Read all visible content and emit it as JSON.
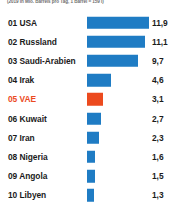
{
  "chart_data": {
    "type": "bar",
    "title": "",
    "subtitle": "(2019 in Mio. Barrels pro Tag, 1 Barrel = 159 l)",
    "xlabel": "",
    "ylabel": "",
    "orientation": "horizontal",
    "grid": false,
    "legend": false,
    "xlim": [
      0,
      12.1
    ],
    "categories": [
      "01 USA",
      "02 Russland",
      "03 Saudi-Arabien",
      "04 Irak",
      "05 VAE",
      "06 Kuwait",
      "07 Iran",
      "08 Nigeria",
      "09 Angola",
      "10 Libyen"
    ],
    "values": [
      11.9,
      11.1,
      9.7,
      4.6,
      3.1,
      2.7,
      2.3,
      1.6,
      1.5,
      1.3
    ],
    "value_labels": [
      "11,9",
      "11,1",
      "9,7",
      "4,6",
      "3,1",
      "2,7",
      "2,3",
      "1,6",
      "1,5",
      "1,3"
    ],
    "highlight_index": 4,
    "colors": {
      "bar": "#1f7cc4",
      "bar_highlight": "#ec4a1e",
      "text": "#1b1b1b",
      "text_highlight": "#ec4a1e",
      "subtitle": "#6e6e6e",
      "background": "#ffffff"
    }
  },
  "rows": [
    {
      "rank": "01",
      "label": "01 USA",
      "value": "11,9",
      "pct": 100.0,
      "highlight": false
    },
    {
      "rank": "02",
      "label": "02 Russland",
      "value": "11,1",
      "pct": 93.3,
      "highlight": false
    },
    {
      "rank": "03",
      "label": "03 Saudi-Arabien",
      "value": "9,7",
      "pct": 81.5,
      "highlight": false
    },
    {
      "rank": "04",
      "label": "04 Irak",
      "value": "4,6",
      "pct": 38.7,
      "highlight": false
    },
    {
      "rank": "05",
      "label": "05 VAE",
      "value": "3,1",
      "pct": 26.1,
      "highlight": true
    },
    {
      "rank": "06",
      "label": "06 Kuwait",
      "value": "2,7",
      "pct": 22.7,
      "highlight": false
    },
    {
      "rank": "07",
      "label": "07 Iran",
      "value": "2,3",
      "pct": 19.3,
      "highlight": false
    },
    {
      "rank": "08",
      "label": "08 Nigeria",
      "value": "1,6",
      "pct": 13.4,
      "highlight": false
    },
    {
      "rank": "09",
      "label": "09 Angola",
      "value": "1,5",
      "pct": 12.6,
      "highlight": false
    },
    {
      "rank": "10",
      "label": "10 Libyen",
      "value": "1,3",
      "pct": 10.9,
      "highlight": false
    }
  ]
}
